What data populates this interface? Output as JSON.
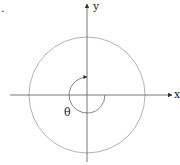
{
  "diagram": {
    "type": "polar-angle",
    "corner_mark": ".",
    "axes": {
      "x_label": "x",
      "y_label": "y"
    },
    "angle_label": "θ",
    "colors": {
      "axis": "#444444",
      "circle": "#9a9a9a",
      "arc": "#666666",
      "text": "#222222"
    },
    "geometry": {
      "center": [
        87,
        95
      ],
      "circle_radius": 58,
      "arc_radius": 18
    }
  }
}
